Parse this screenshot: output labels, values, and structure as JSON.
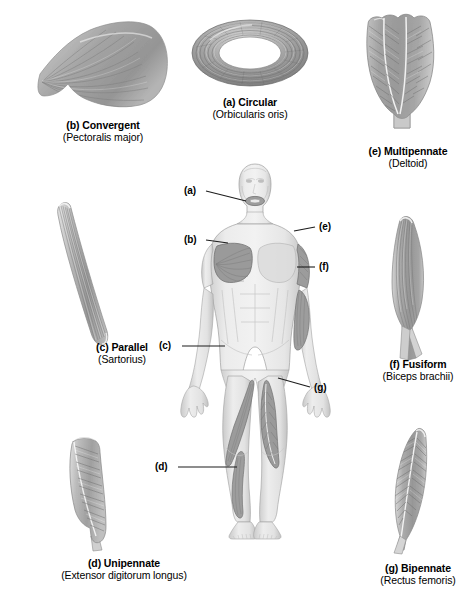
{
  "figure": {
    "background_color": "#ffffff",
    "text_color": "#000000",
    "leader_line_color": "#1c1c1c",
    "muscle_fill_light": "#d4d4d4",
    "muscle_fill_mid": "#a8a8a8",
    "muscle_fill_dark": "#7d7d7d",
    "body_fill": "#e3e3e3",
    "highlight_muscle_fill": "#9a9a9a"
  },
  "panels": [
    {
      "key": "b",
      "letter": "(b)",
      "name": "Convergent",
      "example": "(Pectoralis major)",
      "icon": "convergent-muscle-illustration"
    },
    {
      "key": "a",
      "letter": "(a)",
      "name": "Circular",
      "example": "(Orbicularis oris)",
      "icon": "circular-muscle-illustration"
    },
    {
      "key": "e",
      "letter": "(e)",
      "name": "Multipennate",
      "example": "(Deltoid)",
      "icon": "multipennate-muscle-illustration"
    },
    {
      "key": "c",
      "letter": "(c)",
      "name": "Parallel",
      "example": "(Sartorius)",
      "icon": "parallel-muscle-illustration"
    },
    {
      "key": "f",
      "letter": "(f)",
      "name": "Fusiform",
      "example": "(Biceps brachii)",
      "icon": "fusiform-muscle-illustration"
    },
    {
      "key": "d",
      "letter": "(d)",
      "name": "Unipennate",
      "example": "(Extensor digitorum longus)",
      "icon": "unipennate-muscle-illustration"
    },
    {
      "key": "g",
      "letter": "(g)",
      "name": "Bipennate",
      "example": "(Rectus femoris)",
      "icon": "bipennate-muscle-illustration"
    }
  ],
  "body_diagram": {
    "icon": "anterior-human-body-figure",
    "callouts": [
      {
        "key": "a",
        "label": "(a)",
        "target": "orbicularis-oris-mouth"
      },
      {
        "key": "b",
        "label": "(b)",
        "target": "pectoralis-major-chest"
      },
      {
        "key": "c",
        "label": "(c)",
        "target": "sartorius-thigh"
      },
      {
        "key": "d",
        "label": "(d)",
        "target": "extensor-digitorum-longus-shin"
      },
      {
        "key": "e",
        "label": "(e)",
        "target": "deltoid-shoulder"
      },
      {
        "key": "f",
        "label": "(f)",
        "target": "biceps-brachii-upper-arm"
      },
      {
        "key": "g",
        "label": "(g)",
        "target": "rectus-femoris-thigh"
      }
    ]
  }
}
